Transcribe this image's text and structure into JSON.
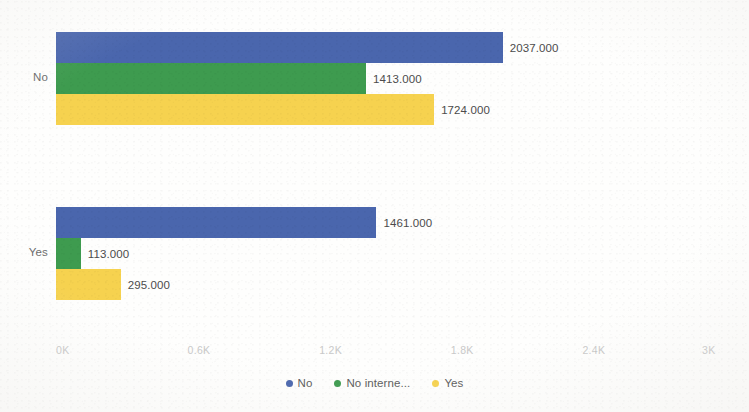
{
  "chart_data": {
    "type": "bar",
    "orientation": "horizontal",
    "grouping": "grouped",
    "title": "",
    "subtitle": "",
    "xlabel": "",
    "ylabel": "",
    "categories": [
      "No",
      "Yes"
    ],
    "series": [
      {
        "name": "No",
        "color": "#4A66AD",
        "values": [
          2037,
          1461
        ],
        "labels": [
          "2037.000",
          "1461.000"
        ]
      },
      {
        "name": "No interne...",
        "color": "#3E9B4F",
        "values": [
          1413,
          113
        ],
        "labels": [
          "1413.000",
          "113.000"
        ]
      },
      {
        "name": "Yes",
        "color": "#F6D24F",
        "values": [
          1724,
          295
        ],
        "labels": [
          "1724.000",
          "295.000"
        ]
      }
    ],
    "xlim": [
      0,
      3000
    ],
    "x_tick_values": [
      0,
      600,
      1200,
      1800,
      2400,
      3000
    ],
    "x_tick_labels": [
      "0K",
      "0.6K",
      "1.2K",
      "1.8K",
      "2.4K",
      "3K"
    ],
    "grid": false,
    "legend_position": "bottom",
    "legend_entries": [
      "No",
      "No interne...",
      "Yes"
    ],
    "data_labels_shown": true
  },
  "axis": {
    "ticks": [
      {
        "label": "0K",
        "value": 0
      },
      {
        "label": "0.6K",
        "value": 600
      },
      {
        "label": "1.2K",
        "value": 1200
      },
      {
        "label": "1.8K",
        "value": 1800
      },
      {
        "label": "2.4K",
        "value": 2400
      },
      {
        "label": "3K",
        "value": 3000
      }
    ],
    "tick_color": "#c9c9c9"
  },
  "groups": [
    {
      "label": "No",
      "bars": [
        {
          "series": "No",
          "value": 2037,
          "label": "2037.000",
          "color": "#4A66AD"
        },
        {
          "series": "No interne...",
          "value": 1413,
          "label": "1413.000",
          "color": "#3E9B4F"
        },
        {
          "series": "Yes",
          "value": 1724,
          "label": "1724.000",
          "color": "#F6D24F"
        }
      ]
    },
    {
      "label": "Yes",
      "bars": [
        {
          "series": "No",
          "value": 1461,
          "label": "1461.000",
          "color": "#4A66AD"
        },
        {
          "series": "No interne...",
          "value": 113,
          "label": "113.000",
          "color": "#3E9B4F"
        },
        {
          "series": "Yes",
          "value": 295,
          "label": "295.000",
          "color": "#F6D24F"
        }
      ]
    }
  ],
  "legend": {
    "items": [
      {
        "label": "No",
        "color": "#4A66AD"
      },
      {
        "label": "No interne...",
        "color": "#3E9B4F"
      },
      {
        "label": "Yes",
        "color": "#F6D24F"
      }
    ]
  },
  "colors": {
    "series_no": "#4A66AD",
    "series_no_internet": "#3E9B4F",
    "series_yes": "#F6D24F",
    "background": "#fefefd",
    "label_text": "#4c4c4c",
    "axis_text": "#c9c9c9",
    "category_text": "#6d6d6d"
  }
}
